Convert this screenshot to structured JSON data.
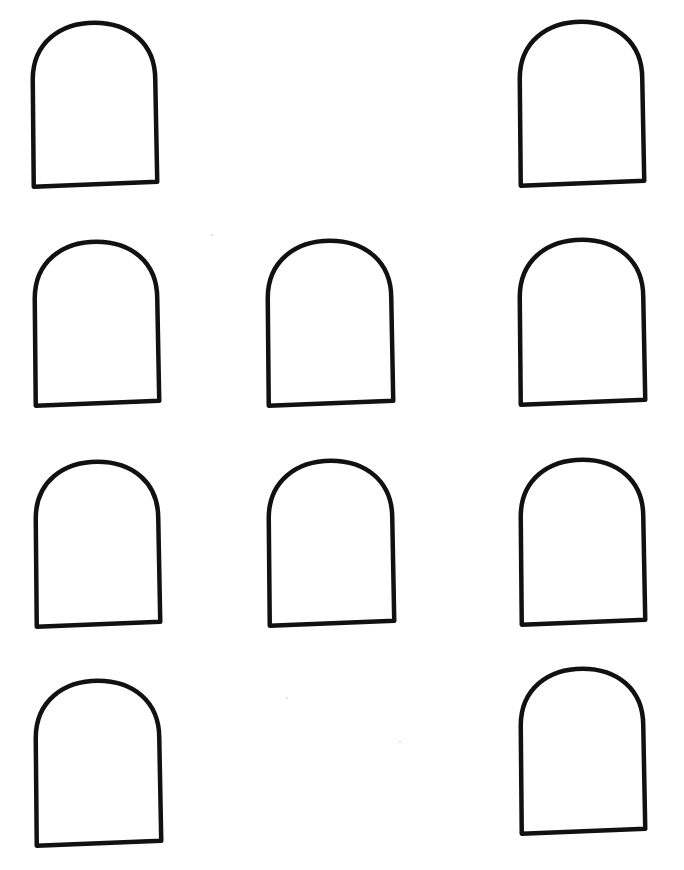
{
  "page": {
    "width": 684,
    "height": 870,
    "background": "#ffffff"
  },
  "style": {
    "stroke_color": "#111111",
    "stroke_width": 4.5
  },
  "shapes": [
    {
      "id": "arch-r1-left",
      "row": 1,
      "col": "left",
      "x": 30,
      "y": 20,
      "w": 128,
      "h": 166,
      "tilt": -1.2
    },
    {
      "id": "arch-r1-right",
      "row": 1,
      "col": "right",
      "x": 517,
      "y": 19,
      "w": 128,
      "h": 166,
      "tilt": -1.2
    },
    {
      "id": "arch-r2-left",
      "row": 2,
      "col": "left",
      "x": 32,
      "y": 239,
      "w": 128,
      "h": 166,
      "tilt": -1.2
    },
    {
      "id": "arch-r2-middle",
      "row": 2,
      "col": "middle",
      "x": 265,
      "y": 238,
      "w": 129,
      "h": 167,
      "tilt": -1.2
    },
    {
      "id": "arch-r2-right",
      "row": 2,
      "col": "right",
      "x": 517,
      "y": 237,
      "w": 129,
      "h": 167,
      "tilt": -1.2
    },
    {
      "id": "arch-r3-left",
      "row": 3,
      "col": "left",
      "x": 33,
      "y": 459,
      "w": 128,
      "h": 167,
      "tilt": -1.2
    },
    {
      "id": "arch-r3-middle",
      "row": 3,
      "col": "middle",
      "x": 266,
      "y": 458,
      "w": 129,
      "h": 167,
      "tilt": -1.2
    },
    {
      "id": "arch-r3-right",
      "row": 3,
      "col": "right",
      "x": 518,
      "y": 457,
      "w": 128,
      "h": 167,
      "tilt": -1.2
    },
    {
      "id": "arch-r4-left",
      "row": 4,
      "col": "left",
      "x": 33,
      "y": 678,
      "w": 129,
      "h": 167,
      "tilt": -1.2
    },
    {
      "id": "arch-r4-right",
      "row": 4,
      "col": "right",
      "x": 518,
      "y": 666,
      "w": 128,
      "h": 167,
      "tilt": -1.2
    }
  ],
  "specks": [
    {
      "x": 399,
      "y": 741
    },
    {
      "x": 211,
      "y": 234
    },
    {
      "x": 286,
      "y": 697
    }
  ]
}
